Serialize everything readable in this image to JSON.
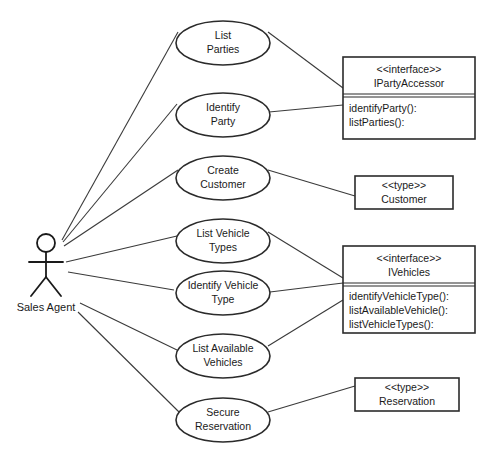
{
  "diagram": {
    "type": "uml-use-case-diagram",
    "title": "",
    "actor": {
      "name": "Sales Agent",
      "icon": "stick-figure-actor-icon",
      "x": 46,
      "y": 265
    },
    "use_cases": [
      {
        "id": "list-parties",
        "line1": "List",
        "line2": "Parties",
        "cx": 223,
        "cy": 43
      },
      {
        "id": "identify-party",
        "line1": "Identify",
        "line2": "Party",
        "cx": 223,
        "cy": 115
      },
      {
        "id": "create-customer",
        "line1": "Create",
        "line2": "Customer",
        "cx": 223,
        "cy": 178
      },
      {
        "id": "list-vehicle-types",
        "line1": "List Vehicle",
        "line2": "Types",
        "cx": 223,
        "cy": 241
      },
      {
        "id": "identify-vehicle-type",
        "line1": "Identify Vehicle",
        "line2": "Type",
        "cx": 223,
        "cy": 293
      },
      {
        "id": "list-available-vehicles",
        "line1": "List Available",
        "line2": "Vehicles",
        "cx": 223,
        "cy": 356
      },
      {
        "id": "secure-reservation",
        "line1": "Secure",
        "line2": "Reservation",
        "cx": 223,
        "cy": 420
      }
    ],
    "classifiers": [
      {
        "id": "iparty-accessor",
        "kind": "interface",
        "stereotype": "<<interface>>",
        "name": "IPartyAccessor",
        "methods": [
          "identifyParty():",
          "listParties():"
        ],
        "x": 343,
        "y": 57,
        "w": 132,
        "h": 82,
        "header_h": 37
      },
      {
        "id": "customer-type",
        "kind": "type",
        "stereotype": "<<type>>",
        "name": "Customer",
        "methods": [],
        "x": 355,
        "y": 176,
        "w": 98,
        "h": 33,
        "header_h": 33
      },
      {
        "id": "ivehicles",
        "kind": "interface",
        "stereotype": "<<interface>>",
        "name": "IVehicles",
        "methods": [
          "identifyVehicleType():",
          "listAvailableVehicle():",
          "listVehicleTypes():"
        ],
        "x": 343,
        "y": 246,
        "w": 132,
        "h": 87,
        "header_h": 35
      },
      {
        "id": "reservation-type",
        "kind": "type",
        "stereotype": "<<type>>",
        "name": "Reservation",
        "methods": [],
        "x": 355,
        "y": 378,
        "w": 104,
        "h": 33,
        "header_h": 33
      }
    ],
    "associations": [
      {
        "id": "actor-list-parties",
        "from": "Sales Agent",
        "to": "List Parties"
      },
      {
        "id": "actor-identify-party",
        "from": "Sales Agent",
        "to": "Identify Party"
      },
      {
        "id": "actor-create-customer",
        "from": "Sales Agent",
        "to": "Create Customer"
      },
      {
        "id": "actor-list-vehicle-types",
        "from": "Sales Agent",
        "to": "List Vehicle Types"
      },
      {
        "id": "actor-identify-vehicle-type",
        "from": "Sales Agent",
        "to": "Identify Vehicle Type"
      },
      {
        "id": "actor-list-available-vehicles",
        "from": "Sales Agent",
        "to": "List Available Vehicles"
      },
      {
        "id": "actor-secure-reservation",
        "from": "Sales Agent",
        "to": "Secure Reservation"
      },
      {
        "id": "list-parties-iparty",
        "from": "List Parties",
        "to": "IPartyAccessor"
      },
      {
        "id": "identify-party-iparty",
        "from": "Identify Party",
        "to": "IPartyAccessor"
      },
      {
        "id": "create-customer-customer",
        "from": "Create Customer",
        "to": "Customer"
      },
      {
        "id": "list-vehicle-types-ivehicles",
        "from": "List Vehicle Types",
        "to": "IVehicles"
      },
      {
        "id": "identify-vehicle-type-ivehicles",
        "from": "Identify Vehicle Type",
        "to": "IVehicles"
      },
      {
        "id": "list-available-ivehicles",
        "from": "List Available Vehicles",
        "to": "IVehicles"
      },
      {
        "id": "secure-reservation-reservation",
        "from": "Secure Reservation",
        "to": "Reservation"
      }
    ],
    "colors": {
      "background": "#ffffff",
      "stroke": "#2b2b2b",
      "line": "#3a3a3a",
      "text": "#1a1a1a"
    }
  }
}
